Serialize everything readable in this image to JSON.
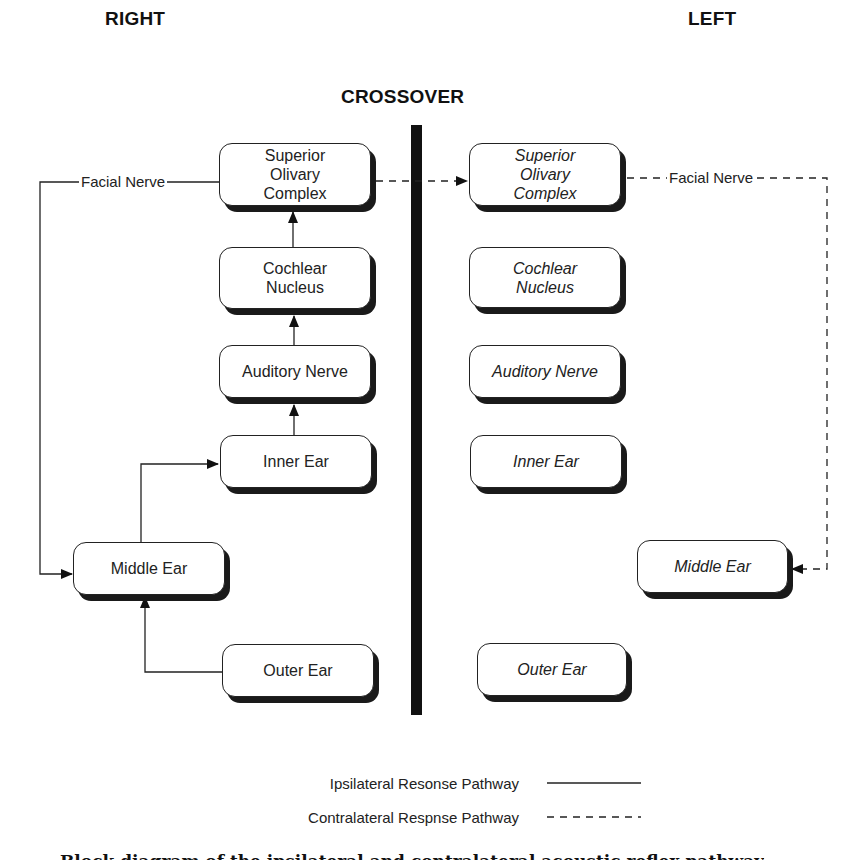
{
  "headings": {
    "right": "RIGHT",
    "left": "LEFT",
    "crossover": "CROSSOVER"
  },
  "right_side": {
    "boxes": [
      {
        "id": "superior-olivary-complex",
        "label": "Superior\nOlivary\nComplex"
      },
      {
        "id": "cochlear-nucleus",
        "label": "Cochlear\nNucleus"
      },
      {
        "id": "auditory-nerve",
        "label": "Auditory Nerve"
      },
      {
        "id": "inner-ear",
        "label": "Inner Ear"
      },
      {
        "id": "middle-ear",
        "label": "Middle Ear"
      },
      {
        "id": "outer-ear",
        "label": "Outer Ear"
      }
    ],
    "facial_nerve_label": "Facial Nerve"
  },
  "left_side": {
    "boxes": [
      {
        "id": "superior-olivary-complex",
        "label": "Superior\nOlivary\nComplex"
      },
      {
        "id": "cochlear-nucleus",
        "label": "Cochlear\nNucleus"
      },
      {
        "id": "auditory-nerve",
        "label": "Auditory Nerve"
      },
      {
        "id": "inner-ear",
        "label": "Inner Ear"
      },
      {
        "id": "middle-ear",
        "label": "Middle Ear"
      },
      {
        "id": "outer-ear",
        "label": "Outer Ear"
      }
    ],
    "facial_nerve_label": "Facial Nerve"
  },
  "connections": [
    {
      "from": "right.outer-ear",
      "to": "right.middle-ear",
      "style": "solid"
    },
    {
      "from": "right.middle-ear",
      "to": "right.inner-ear",
      "style": "solid"
    },
    {
      "from": "right.inner-ear",
      "to": "right.auditory-nerve",
      "style": "solid"
    },
    {
      "from": "right.auditory-nerve",
      "to": "right.cochlear-nucleus",
      "style": "solid"
    },
    {
      "from": "right.cochlear-nucleus",
      "to": "right.superior-olivary-complex",
      "style": "solid"
    },
    {
      "from": "right.superior-olivary-complex",
      "to": "right.middle-ear",
      "via": "Facial Nerve",
      "style": "solid"
    },
    {
      "from": "right.superior-olivary-complex",
      "to": "left.superior-olivary-complex",
      "style": "dashed"
    },
    {
      "from": "left.superior-olivary-complex",
      "to": "left.middle-ear",
      "via": "Facial Nerve",
      "style": "dashed"
    }
  ],
  "legend": {
    "items": [
      {
        "label": "Ipsilateral Resonse Pathway",
        "line_style": "solid"
      },
      {
        "label": "Contralateral Respnse Pathway",
        "line_style": "dashed"
      }
    ]
  },
  "caption": "Block diagram of the ipsilateral and contralateral acoustic reflex pathway",
  "colors": {
    "ink": "#1a1a1a",
    "background": "#ffffff"
  }
}
